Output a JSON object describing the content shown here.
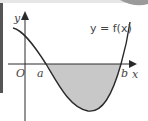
{
  "diagram": {
    "function_label": "y = f(x)",
    "y_axis_label": "y",
    "x_axis_label": "x",
    "origin_label": "O",
    "root_a_label": "a",
    "root_b_label": "b",
    "colors": {
      "curve": "#2a2a2a",
      "axis": "#2a2a2a",
      "shade": "#c8c8c8",
      "corner": "#9a9a9a"
    }
  }
}
